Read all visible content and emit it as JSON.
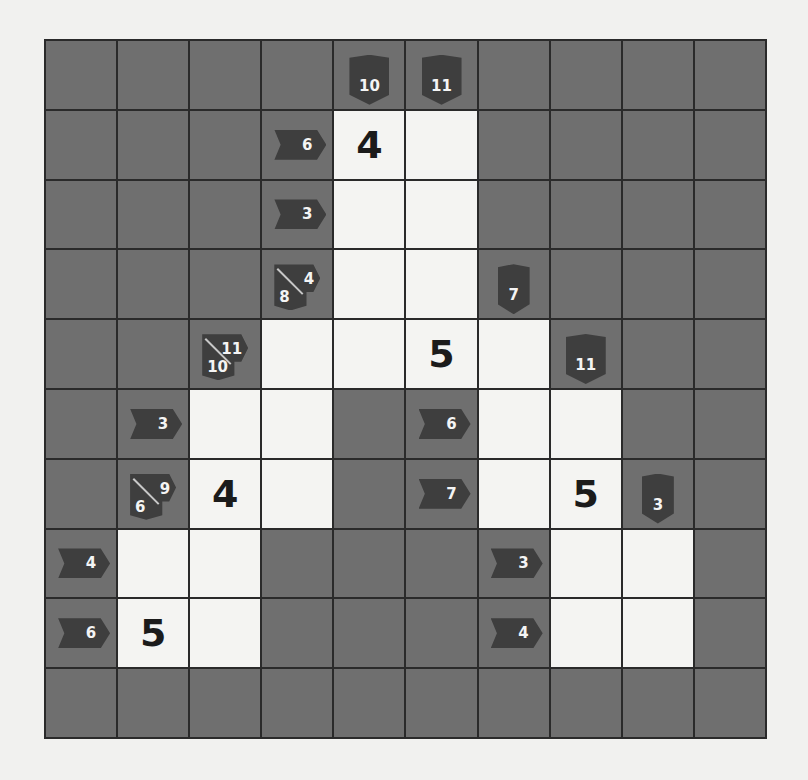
{
  "puzzle": {
    "type": "kakuro",
    "rows": 10,
    "cols": 10,
    "colors": {
      "block": "#6f6f6f",
      "white": "#f4f4f2",
      "clue": "#3e3e3e",
      "grid": "#2a2a2a"
    },
    "clues": {
      "r0c4": {
        "down": "10"
      },
      "r0c5": {
        "down": "11"
      },
      "r1c3": {
        "right": "6"
      },
      "r2c3": {
        "right": "3"
      },
      "r3c3": {
        "down": "8",
        "right": "4"
      },
      "r3c6": {
        "down": "7"
      },
      "r4c2": {
        "down": "10",
        "right": "11"
      },
      "r4c7": {
        "down": "11"
      },
      "r5c1": {
        "right": "3"
      },
      "r5c5": {
        "right": "6"
      },
      "r6c1": {
        "down": "6",
        "right": "9"
      },
      "r6c5": {
        "right": "7"
      },
      "r6c8": {
        "down": "3"
      },
      "r7c0": {
        "right": "4"
      },
      "r7c6": {
        "right": "3"
      },
      "r8c0": {
        "right": "6"
      },
      "r8c6": {
        "right": "4"
      }
    },
    "given_digits": {
      "r1c4": "4",
      "r4c5": "5",
      "r6c2": "4",
      "r6c7": "5",
      "r8c1": "5"
    }
  }
}
